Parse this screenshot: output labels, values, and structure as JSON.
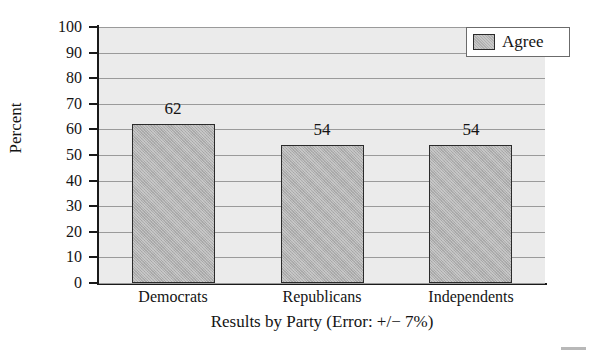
{
  "chart_data": {
    "type": "bar",
    "title": "",
    "title_note": "title is cropped off the top edge of the screenshot and unreadable",
    "categories": [
      "Democrats",
      "Republicans",
      "Independents"
    ],
    "values": [
      62,
      54,
      54
    ],
    "series": [
      {
        "name": "Agree",
        "values": [
          62,
          54,
          54
        ]
      }
    ],
    "xlabel": "Results by Party (Error: +/− 7%)",
    "ylabel": "Percent",
    "ylim": [
      0,
      100
    ],
    "ytick_step": 10,
    "yticks": [
      0,
      10,
      20,
      30,
      40,
      50,
      60,
      70,
      80,
      90,
      100
    ],
    "ytick_labels": [
      "0",
      "10",
      "20",
      "30",
      "40",
      "50",
      "60",
      "70",
      "80",
      "90",
      "100"
    ],
    "bar_value_labels": [
      "62",
      "54",
      "54"
    ],
    "grid": true,
    "grid_axis": "y",
    "legend": {
      "position": "top-right",
      "entries": [
        {
          "label": "Agree",
          "color": "#b0b0b0"
        }
      ]
    },
    "colors": {
      "bar_fill": "#b0b0b0",
      "bar_outline": "#2b2b2b",
      "plot_background": "#ebebeb",
      "gridline": "#9a9a9a",
      "axis": "#1a1a1a",
      "text": "#141414",
      "legend_background": "#ffffff",
      "page_background": "#ffffff"
    }
  }
}
